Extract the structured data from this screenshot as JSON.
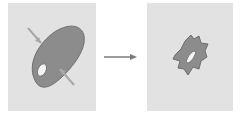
{
  "diagram": {
    "type": "cell-shape-transition",
    "panels": [
      {
        "id": "before",
        "description": "Smooth oval cell with nucleus, crossed by two arrows indicating compression"
      },
      {
        "id": "after",
        "description": "Shrunken, irregular crenated cell with elongated nucleus"
      }
    ],
    "arrow": {
      "direction": "right"
    },
    "colors": {
      "panel_background": "#e2e2e2",
      "cell_fill": "#8c8c8c",
      "cell_outline": "#6e6e6e",
      "nucleus_fill": "#f4f4f4",
      "arrow_color": "#7a7a7a",
      "compression_arrow_color": "#a8a8a8"
    }
  }
}
